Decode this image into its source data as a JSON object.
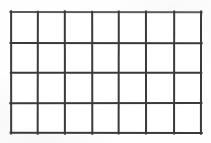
{
  "document": {
    "title": "Empty grid table",
    "type": "line-grid",
    "width": 211,
    "height": 143,
    "background_color": "#fefefe"
  },
  "grid": {
    "columns": 7,
    "rows": 4,
    "cell_count": 28,
    "line_color": "#3a3a3a",
    "line_color_light": "#5c5c5c",
    "line_width": 2,
    "outer_line_width": 2,
    "cell_fill": "#ffffff",
    "bounds": {
      "left": 11,
      "top": 12,
      "right": 201,
      "bottom": 133,
      "width": 190,
      "height": 121
    },
    "vertical_line_x": [
      11,
      38,
      65,
      92,
      119,
      146,
      174,
      201
    ],
    "horizontal_line_y": [
      12,
      43,
      73,
      103,
      133
    ],
    "column_widths": [
      27,
      27,
      27,
      27,
      27,
      28,
      27
    ],
    "row_heights": [
      31,
      30,
      30,
      30
    ],
    "cells": [
      [
        "",
        "",
        "",
        "",
        "",
        "",
        ""
      ],
      [
        "",
        "",
        "",
        "",
        "",
        "",
        ""
      ],
      [
        "",
        "",
        "",
        "",
        "",
        "",
        ""
      ],
      [
        "",
        "",
        "",
        "",
        "",
        "",
        ""
      ]
    ]
  }
}
